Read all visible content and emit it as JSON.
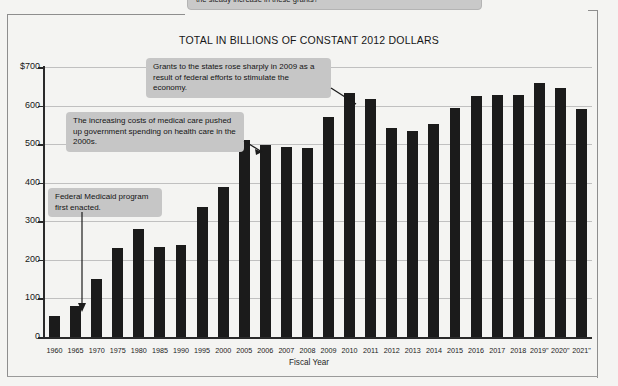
{
  "page": {
    "top_callout_text": "the steady increase in these grants?",
    "ghost_text": ""
  },
  "chart_data": {
    "type": "bar",
    "title": "TOTAL IN BILLIONS OF CONSTANT 2012 DOLLARS",
    "xlabel": "Fiscal Year",
    "ylabel": "",
    "ylim": [
      0,
      700
    ],
    "yticks": [
      0,
      100,
      200,
      300,
      400,
      500,
      600,
      700
    ],
    "ytick_labels": [
      "0",
      "100",
      "200",
      "300",
      "400",
      "500",
      "600",
      "$700"
    ],
    "grid": true,
    "legend": "none",
    "bar_color": "#1b1b1b",
    "categories": [
      "1960",
      "1965",
      "1970",
      "1975",
      "1980",
      "1985",
      "1990",
      "1995",
      "2000",
      "2005",
      "2006",
      "2007",
      "2008",
      "2009",
      "2010",
      "2011",
      "2012",
      "2013",
      "2014",
      "2015",
      "2016",
      "2017",
      "2018",
      "2019\"",
      "2020\"",
      "2021\""
    ],
    "values": [
      55,
      80,
      150,
      230,
      280,
      233,
      238,
      337,
      388,
      510,
      498,
      492,
      490,
      570,
      633,
      618,
      543,
      535,
      553,
      595,
      625,
      627,
      628,
      658,
      645,
      592
    ],
    "annotations": [
      {
        "id": "callout-2009",
        "text": "Grants to the states rose sharply in 2009 as a result of federal efforts to stimulate the economy.",
        "points_to": "1960"
      },
      {
        "id": "callout-medical",
        "text": "The increasing costs of medical care pushed up government spending on health care in the 2000s.",
        "points_to": "2005"
      },
      {
        "id": "callout-medicaid",
        "text": "Federal Medicaid program first enacted.",
        "points_to": "1965"
      }
    ]
  }
}
